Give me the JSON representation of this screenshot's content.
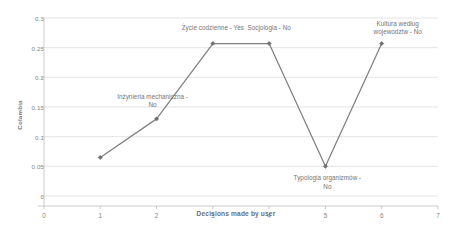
{
  "chart_data": {
    "type": "line",
    "title": "",
    "subtitle": "",
    "xlabel": "Decisions made by user",
    "ylabel": "Colambia",
    "x": [
      1,
      2,
      3,
      4,
      5,
      6
    ],
    "values": [
      0.065,
      0.13,
      0.257,
      0.257,
      0.05,
      0.257
    ],
    "series": [
      {
        "name": "",
        "x": [
          1,
          2,
          3,
          4,
          5,
          6
        ],
        "values": [
          0.065,
          0.13,
          0.257,
          0.257,
          0.05,
          0.257
        ]
      }
    ],
    "xlim": [
      0,
      7
    ],
    "ylim": [
      0,
      0.3
    ],
    "xticks": [
      "0",
      "1",
      "2",
      "3",
      "4",
      "5",
      "6",
      "7"
    ],
    "xtick_values": [
      0,
      1,
      2,
      3,
      4,
      5,
      6,
      7
    ],
    "yticks": [
      "0",
      "0.05",
      "0.1",
      "0.15",
      "0.2",
      "0.25",
      "0.3"
    ],
    "ytick_values": [
      0,
      0.05,
      0.1,
      0.15,
      0.2,
      0.25,
      0.3
    ],
    "grid": "horizontal",
    "legend": "none",
    "line_color": "#808080",
    "marker": "diamond",
    "marker_color": "#707070",
    "grid_color": "#d9d9d9",
    "axis_color": "#bfbfbf",
    "annotations": [
      {
        "text": "Inżynieria mechaniczna -\nNo",
        "x": 2,
        "y": 0.13,
        "position": "above-left"
      },
      {
        "text": "Życie codzienne - Yes",
        "x": 3,
        "y": 0.257,
        "position": "above"
      },
      {
        "text": "Socjologia - No",
        "x": 4,
        "y": 0.257,
        "position": "above"
      },
      {
        "text": "Typologia organizmów -\nNo",
        "x": 5,
        "y": 0.05,
        "position": "below"
      },
      {
        "text": "Kultura według\nwojewodztw - No",
        "x": 6,
        "y": 0.257,
        "position": "above-right"
      }
    ]
  }
}
